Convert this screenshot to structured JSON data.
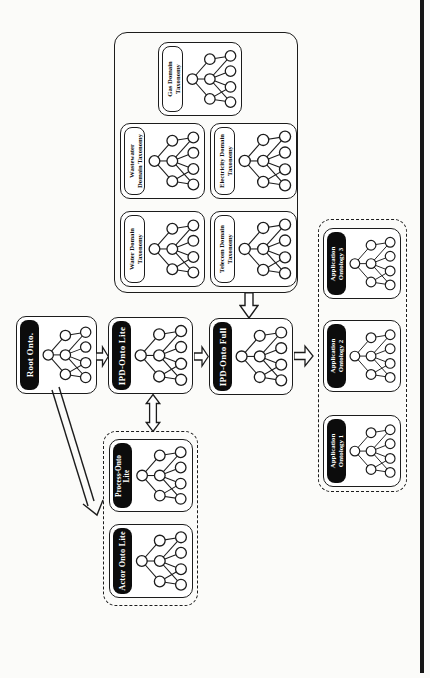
{
  "page": {
    "background": "#fbfbf9",
    "ink": "#1c1c1c",
    "pill_fill": "#0c0c0c",
    "pill_text": "#ffffff"
  },
  "domain_group": {
    "gas": {
      "line1": "Gas Domain",
      "line2": "Taxonomy"
    },
    "wastewater": {
      "line1": "Wastewater",
      "line2": "Domain Taxonomy"
    },
    "electricity": {
      "line1": "Electricity Domain",
      "line2": "Taxonomy"
    },
    "water": {
      "line1": "Water Domain",
      "line2": "Taxonomy"
    },
    "telecom": {
      "line1": "Telecom Domain",
      "line2": "Taxonomy"
    }
  },
  "flow": {
    "root": {
      "label": "Root Onto."
    },
    "ipd_lite": {
      "label": "IPD-Onto Lite"
    },
    "ipd_full": {
      "label": "IPD-Onto Full"
    }
  },
  "application_group": {
    "ontology3": {
      "line1": "Application",
      "line2": "Ontology 3"
    },
    "ontology2": {
      "line1": "Application",
      "line2": "Ontology 2"
    },
    "ontology1": {
      "line1": "Application",
      "line2": "Ontology 1"
    }
  },
  "aspect_group": {
    "process": {
      "line1": "Process-Onto",
      "line2": "Lite"
    },
    "actor": {
      "label": "Actor Onto Lite"
    }
  }
}
